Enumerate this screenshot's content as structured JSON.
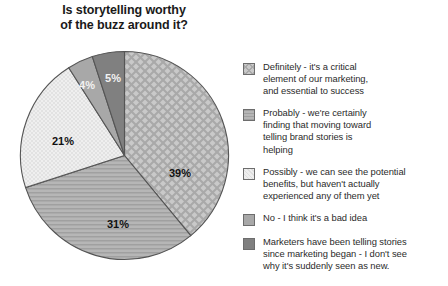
{
  "title": {
    "line1": "Is storytelling worthy",
    "line2": "of the buzz around it?"
  },
  "chart_data": {
    "type": "pie",
    "title": "Is storytelling worthy of the buzz around it?",
    "xlabel": "",
    "ylabel": "",
    "legend_position": "right",
    "grid": false,
    "start_angle_deg": 0,
    "direction": "clockwise",
    "categories": [
      "Definitely - it's a critical element of our marketing, and essential to success",
      "Probably - we're certainly finding that moving toward telling brand stories is helping",
      "Possibly - we can see the potential benefits, but haven't actually experienced any of them yet",
      "No - I think it's a bad idea",
      "Marketers have been telling stories since marketing began - I don't see why it's suddenly seen as new."
    ],
    "values": [
      39,
      31,
      21,
      4,
      5
    ],
    "data_labels": [
      "39%",
      "31%",
      "21%",
      "4%",
      "5%"
    ],
    "colors": [
      "#bdbdbd",
      "#b2b2b2",
      "#eeeeee",
      "#a8a8a8",
      "#808080"
    ],
    "patterns": [
      "diagonal-crosshatch",
      "horizontal-lines",
      "fine-stipple",
      "solid",
      "solid"
    ],
    "slice_border_color": "#555555"
  },
  "legend": {
    "items": [
      {
        "label": "Definitely - it's a critical element of our marketing, and essential to success",
        "lines": [
          "Definitely - it's a critical",
          "element of our marketing,",
          "and essential to success"
        ],
        "value": "39%",
        "swatch": "#bdbdbd"
      },
      {
        "label": "Probably - we're certainly finding that moving toward telling brand stories is helping",
        "lines": [
          "Probably - we're certainly",
          "finding that moving toward",
          "telling brand stories is",
          "helping"
        ],
        "value": "31%",
        "swatch": "#b2b2b2"
      },
      {
        "label": "Possibly - we can see the potential benefits, but haven't actually experienced any of them yet",
        "lines": [
          "Possibly - we can see the potential",
          "benefits, but haven't actually",
          "experienced any of them yet"
        ],
        "value": "21%",
        "swatch": "#eeeeee"
      },
      {
        "label": "No - I think it's a bad idea",
        "lines": [
          "No - I think it's a bad idea"
        ],
        "value": "4%",
        "swatch": "#a8a8a8"
      },
      {
        "label": "Marketers have been telling stories since marketing began - I don't see why it's suddenly seen as new.",
        "lines": [
          "Marketers have been telling stories",
          "since marketing began - I don't see",
          "why it's suddenly seen as new."
        ],
        "value": "5%",
        "swatch": "#808080"
      }
    ]
  }
}
